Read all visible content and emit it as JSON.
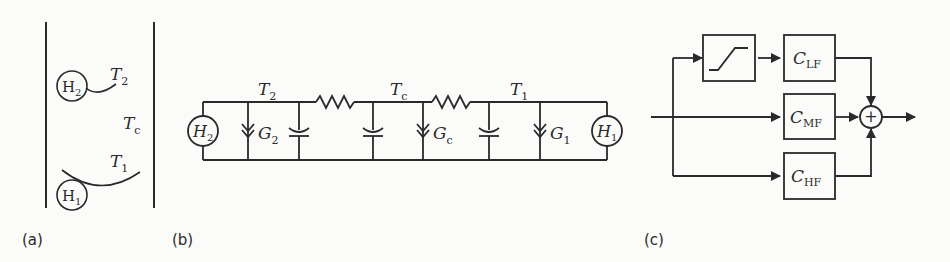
{
  "panels": {
    "a": {
      "caption": "(a)",
      "labels": {
        "H2": "H",
        "H2_sub": "2",
        "H1": "H",
        "H1_sub": "1",
        "T2": "T",
        "T2_sub": "2",
        "Tc": "T",
        "Tc_sub": "c",
        "T1": "T",
        "T1_sub": "1"
      }
    },
    "b": {
      "caption": "(b)",
      "labels": {
        "T2": "T",
        "T2_sub": "2",
        "Tc": "T",
        "Tc_sub": "c",
        "T1": "T",
        "T1_sub": "1",
        "G2": "G",
        "G2_sub": "2",
        "Gc": "G",
        "Gc_sub": "c",
        "G1": "G",
        "G1_sub": "1",
        "H2": "H",
        "H2_sub": "2",
        "H1": "H",
        "H1_sub": "1"
      }
    },
    "c": {
      "caption": "(c)",
      "blocks": [
        {
          "id": "saturation",
          "label": ""
        },
        {
          "id": "clf",
          "label": "C",
          "sub": "LF"
        },
        {
          "id": "cmf",
          "label": "C",
          "sub": "MF"
        },
        {
          "id": "chf",
          "label": "C",
          "sub": "HF"
        }
      ],
      "summing_symbol": "+"
    }
  }
}
